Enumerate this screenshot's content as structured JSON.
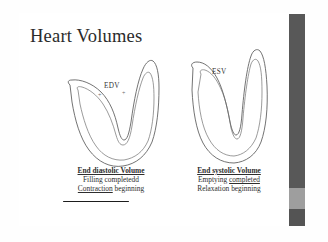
{
  "slide": {
    "title": "Heart Volumes",
    "background_color": "#ffffff",
    "frame_color": "#3a3a3a",
    "edge_band_color": "#585858",
    "edge_band_light_color": "#9e9e9e"
  },
  "diagrams": [
    {
      "name": "end-diastolic-ventricle",
      "label": "EDV",
      "tick_left": "+",
      "tick_right": "+"
    },
    {
      "name": "end-systolic-ventricle",
      "label": "ESV"
    }
  ],
  "captions": {
    "left": {
      "heading": "End diastolic Volume",
      "line2": "Filling completedd",
      "line3_underlined": "Contraction",
      "line3_rest": " beginning"
    },
    "right": {
      "heading": "End systolic Volume",
      "line2_prefix": "Emptying ",
      "line2_underlined": "completed",
      "line3": "Relaxation beginning"
    }
  }
}
